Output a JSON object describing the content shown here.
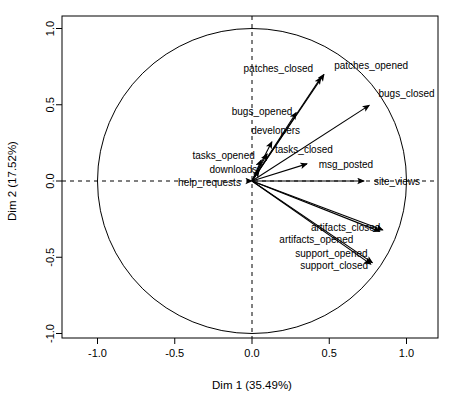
{
  "chart_data": {
    "type": "scatter",
    "plot_kind": "pca-correlation-circle",
    "title": "",
    "xlabel": "Dim 1 (35.49%)",
    "ylabel": "Dim 2 (17.52%)",
    "xlim": [
      -1.18,
      1.18
    ],
    "ylim": [
      -1.1,
      1.1
    ],
    "xticks": [
      "-1.0",
      "-0.5",
      "0.0",
      "0.5",
      "1.0"
    ],
    "xtick_values": [
      -1.0,
      -0.5,
      0.0,
      0.5,
      1.0
    ],
    "yticks": [
      "-1.0",
      "-0.5",
      "0.0",
      "0.5",
      "1.0"
    ],
    "ytick_values": [
      -1.0,
      -0.5,
      0.0,
      0.5,
      1.0
    ],
    "grid": false,
    "legend": "none",
    "unit_circle": true,
    "reference_lines": [
      {
        "orientation": "horizontal",
        "value": 0.0,
        "style": "dashed"
      },
      {
        "orientation": "vertical",
        "value": 0.0,
        "style": "dashed"
      }
    ],
    "origin": [
      0.0,
      0.0
    ],
    "dim1_variance_pct": 35.49,
    "dim2_variance_pct": 17.52,
    "vectors": [
      {
        "label": "patches_opened",
        "x": 0.48,
        "y": 0.72,
        "label_dx": 8,
        "label_dy": -2,
        "anchor": "start"
      },
      {
        "label": "patches_closed",
        "x": 0.46,
        "y": 0.7,
        "label_dx": -10,
        "label_dy": -2,
        "anchor": "end"
      },
      {
        "label": "bugs_closed",
        "x": 0.78,
        "y": 0.51,
        "label_dx": 6,
        "label_dy": -6,
        "anchor": "start"
      },
      {
        "label": "bugs_opened",
        "x": 0.3,
        "y": 0.47,
        "label_dx": -6,
        "label_dy": 6,
        "anchor": "end"
      },
      {
        "label": "developers",
        "x": 0.14,
        "y": 0.28,
        "label_dx": 2,
        "label_dy": -4,
        "anchor": "middle"
      },
      {
        "label": "tasks_closed",
        "x": 0.11,
        "y": 0.2,
        "label_dx": 6,
        "label_dy": 2,
        "anchor": "start"
      },
      {
        "label": "tasks_opened",
        "x": 0.07,
        "y": 0.16,
        "label_dx": -8,
        "label_dy": 2,
        "anchor": "end"
      },
      {
        "label": "downloads",
        "x": 0.06,
        "y": 0.09,
        "label_dx": -4,
        "label_dy": 6,
        "anchor": "end"
      },
      {
        "label": "msg_posted",
        "x": 0.38,
        "y": 0.12,
        "label_dx": 8,
        "label_dy": 5,
        "anchor": "start"
      },
      {
        "label": "site_views",
        "x": 0.75,
        "y": 0.0,
        "label_dx": 6,
        "label_dy": 4,
        "anchor": "start"
      },
      {
        "label": "help_requests",
        "x": -0.02,
        "y": -0.01,
        "label_dx": -8,
        "label_dy": 3,
        "anchor": "end"
      },
      {
        "label": "artifacts_closed",
        "x": 0.87,
        "y": -0.33,
        "label_dx": -6,
        "label_dy": 0,
        "anchor": "end"
      },
      {
        "label": "artifacts_opened",
        "x": 0.85,
        "y": -0.34,
        "label_dx": -30,
        "label_dy": 10,
        "anchor": "end"
      },
      {
        "label": "support_opened",
        "x": 0.8,
        "y": -0.55,
        "label_dx": -8,
        "label_dy": -8,
        "anchor": "end"
      },
      {
        "label": "support_closed",
        "x": 0.79,
        "y": -0.56,
        "label_dx": -6,
        "label_dy": 3,
        "anchor": "end"
      }
    ]
  },
  "axes": {
    "x_title": "Dim 1 (35.49%)",
    "y_title": "Dim 2 (17.52%)",
    "x_tick_labels": [
      "-1.0",
      "-0.5",
      "0.0",
      "0.5",
      "1.0"
    ],
    "y_tick_labels": [
      "-1.0",
      "-0.5",
      "0.0",
      "0.5",
      "1.0"
    ]
  },
  "colors": {
    "background": "#ffffff",
    "foreground": "#000000",
    "arrow": "#000000",
    "circle": "#000000"
  }
}
